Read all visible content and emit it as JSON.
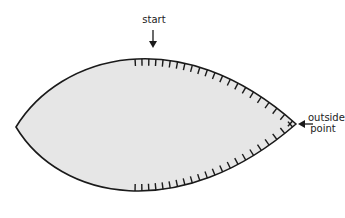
{
  "diagram": {
    "labels": {
      "start": "start",
      "outside_point_line1": "outside",
      "outside_point_line2": "point"
    },
    "colors": {
      "fill": "#e6e6e6",
      "stroke": "#1a1a1a"
    }
  }
}
